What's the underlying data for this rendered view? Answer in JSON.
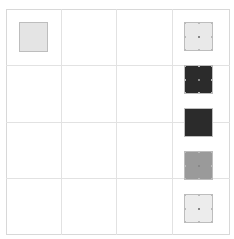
{
  "canvas": {
    "grid": {
      "columns": 4,
      "rows": 4,
      "line_color": "#e2e2e2",
      "border_color": "#d8d8d8"
    }
  },
  "shapes": [
    {
      "id": "shape-1",
      "x": 19,
      "y": 22,
      "w": 29,
      "h": 30,
      "fill": "#e4e4e4",
      "selected": false
    },
    {
      "id": "shape-2",
      "x": 184,
      "y": 22,
      "w": 29,
      "h": 29,
      "fill": "#e9e9e9",
      "selected": true
    },
    {
      "id": "shape-3",
      "x": 184,
      "y": 65,
      "w": 29,
      "h": 29,
      "fill": "#2b2b2b",
      "selected": true
    },
    {
      "id": "shape-4",
      "x": 184,
      "y": 108,
      "w": 29,
      "h": 29,
      "fill": "#2b2b2b",
      "selected": false
    },
    {
      "id": "shape-5",
      "x": 184,
      "y": 151,
      "w": 29,
      "h": 29,
      "fill": "#9a9a9a",
      "selected": true
    },
    {
      "id": "shape-6",
      "x": 184,
      "y": 194,
      "w": 29,
      "h": 29,
      "fill": "#ececec",
      "selected": true
    }
  ]
}
